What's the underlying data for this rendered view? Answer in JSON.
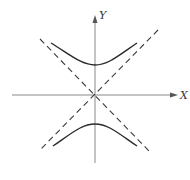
{
  "diagram": {
    "type": "hyperbola-with-asymptotes",
    "axes": {
      "x_label": "X",
      "y_label": "Y"
    },
    "curves": [
      {
        "name": "upper-branch",
        "style": "solid"
      },
      {
        "name": "lower-branch",
        "style": "solid"
      }
    ],
    "asymptotes": [
      {
        "name": "asymptote-positive-slope",
        "style": "dashed"
      },
      {
        "name": "asymptote-negative-slope",
        "style": "dashed"
      }
    ],
    "colors": {
      "axis": "#8a8a8a",
      "curve": "#2a2a2a",
      "asymptote": "#3a3a3a"
    }
  }
}
